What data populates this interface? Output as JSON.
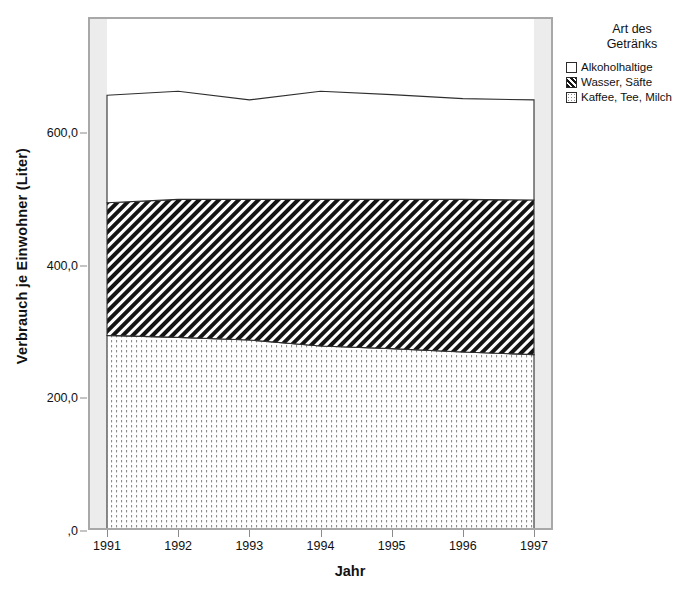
{
  "chart_data": {
    "type": "area",
    "stacked": true,
    "title": "",
    "xlabel": "Jahr",
    "ylabel": "Verbrauch je Einwohner (Liter)",
    "categories": [
      "1991",
      "1992",
      "1993",
      "1994",
      "1995",
      "1996",
      "1997"
    ],
    "x": [
      1991,
      1992,
      1993,
      1994,
      1995,
      1996,
      1997
    ],
    "xlim": [
      1991,
      1997
    ],
    "ylim": [
      0,
      772
    ],
    "ytick_values": [
      0,
      200,
      400,
      600
    ],
    "ytick_labels": [
      ",0",
      "200,0",
      "400,0",
      "600,0"
    ],
    "grid": false,
    "legend_position": "right",
    "legend_title": "Art des\nGetränks",
    "series": [
      {
        "name": "Kaffee, Tee, Milch",
        "pattern": "dotted",
        "fill": "#ffffff",
        "values": [
          295,
          292,
          288,
          279,
          275,
          270,
          266
        ]
      },
      {
        "name": "Wasser, Säfte",
        "pattern": "diagonal-hatch",
        "fill": "#1a1a1a",
        "values": [
          200,
          208,
          212,
          221,
          225,
          230,
          233
        ]
      },
      {
        "name": "Alkoholhaltige",
        "pattern": "solid-white",
        "fill": "#ffffff",
        "values": [
          162,
          163,
          150,
          163,
          158,
          152,
          151
        ]
      }
    ],
    "cumulative": {
      "kaffee_tee_milch_top": [
        295,
        292,
        288,
        279,
        275,
        270,
        266
      ],
      "wasser_saefte_top": [
        495,
        500,
        500,
        500,
        500,
        500,
        499
      ],
      "alkoholhaltige_top": [
        657,
        663,
        650,
        663,
        658,
        652,
        650
      ]
    }
  },
  "axes": {
    "y_title": "Verbrauch je Einwohner (Liter)",
    "x_title": "Jahr"
  },
  "legend": {
    "title": "Art des\nGetränks",
    "items": [
      {
        "label": "Alkoholhaltige",
        "swatch": "swatch-empty-icon"
      },
      {
        "label": "Wasser, Säfte",
        "swatch": "swatch-hatch-icon"
      },
      {
        "label": "Kaffee, Tee, Milch",
        "swatch": "swatch-dotted-icon"
      }
    ]
  },
  "caption": {
    "text": ""
  }
}
